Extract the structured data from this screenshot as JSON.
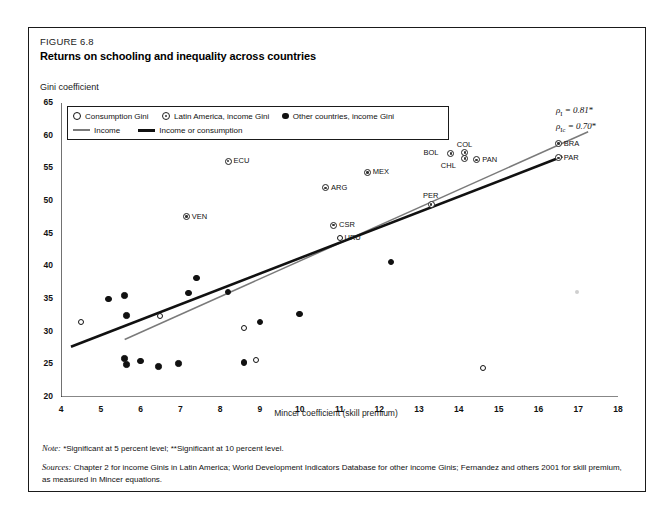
{
  "figure": {
    "number": "FIGURE 6.8",
    "title": "Returns on schooling and inequality across countries"
  },
  "axis": {
    "y_title": "Gini coefficient",
    "x_title": "Mincer coefficient (skill premium)",
    "y_ticks": [
      "20",
      "25",
      "30",
      "35",
      "40",
      "45",
      "50",
      "55",
      "60",
      "65"
    ],
    "x_ticks": [
      "4",
      "5",
      "6",
      "7",
      "8",
      "9",
      "10",
      "11",
      "12",
      "13",
      "14",
      "15",
      "16",
      "17",
      "18"
    ]
  },
  "legend": {
    "items": [
      {
        "label": "Consumption Gini",
        "marker": "hollow-circle-icon"
      },
      {
        "label": "Latin America, income Gini",
        "marker": "target-circle-icon"
      },
      {
        "label": "Other countries, income Gini",
        "marker": "filled-circle-icon"
      },
      {
        "label": "Income",
        "marker": "gray-line-icon"
      },
      {
        "label": "Income or consumption",
        "marker": "black-line-icon"
      }
    ]
  },
  "annotations": {
    "rho_income": {
      "symbol": "ρ",
      "sub": "I",
      "text": " = 0.81",
      "star": "*"
    },
    "rho_income_consumption": {
      "symbol": "ρ",
      "sub": "Ic",
      "text": " = 0.70",
      "star": "*"
    }
  },
  "footnotes": {
    "note_label": "Note:",
    "note_text": "*Significant at 5 percent level; **Significant at 10 percent level.",
    "sources_label": "Sources:",
    "sources_text": "Chapter 2 for income Ginis in Latin America; World Development Indicators Database for other income Ginis; Fernandez and others 2001 for skill premium, as measured in Mincer equations."
  },
  "colors": {
    "income_line": "#7a7a7a",
    "income_or_consumption_line": "#111111",
    "frame": "#1a1a1a"
  },
  "chart_data": {
    "type": "scatter",
    "title": "Returns on schooling and inequality across countries",
    "xlabel": "Mincer coefficient (skill premium)",
    "ylabel": "Gini coefficient",
    "xlim": [
      4,
      18
    ],
    "ylim": [
      20,
      65
    ],
    "grid": false,
    "legend_position": "top-left inside plot",
    "series": [
      {
        "name": "Latin America, income Gini",
        "marker": "target-circle",
        "points": [
          {
            "label": "ECU",
            "x": 8.2,
            "y": 56.1,
            "label_pos": "right"
          },
          {
            "label": "VEN",
            "x": 7.15,
            "y": 47.6,
            "label_pos": "right"
          },
          {
            "label": "ARG",
            "x": 10.65,
            "y": 52.0,
            "label_pos": "right"
          },
          {
            "label": "MEX",
            "x": 11.7,
            "y": 54.4,
            "label_pos": "right"
          },
          {
            "label": "CSR",
            "x": 10.85,
            "y": 46.3,
            "label_pos": "right"
          },
          {
            "label": "PER",
            "x": 13.3,
            "y": 49.5,
            "label_pos": "above"
          },
          {
            "label": "BOL",
            "x": 13.8,
            "y": 57.3,
            "label_pos": "left"
          },
          {
            "label": "COL",
            "x": 14.15,
            "y": 57.4,
            "label_pos": "above"
          },
          {
            "label": "CHL",
            "x": 14.15,
            "y": 56.5,
            "label_pos": "below-left"
          },
          {
            "label": "PAN",
            "x": 14.45,
            "y": 56.3,
            "label_pos": "right"
          },
          {
            "label": "BRA",
            "x": 16.5,
            "y": 58.8,
            "label_pos": "right"
          },
          {
            "label": "PAR",
            "x": 16.5,
            "y": 56.6,
            "label_pos": "right"
          }
        ]
      },
      {
        "name": "Consumption Gini",
        "marker": "hollow-circle",
        "points": [
          {
            "label": "URU",
            "x": 11.0,
            "y": 44.4,
            "label_pos": "right"
          },
          {
            "label": "",
            "x": 4.5,
            "y": 31.5
          },
          {
            "label": "",
            "x": 6.5,
            "y": 32.4
          },
          {
            "label": "",
            "x": 8.6,
            "y": 30.6
          },
          {
            "label": "",
            "x": 8.9,
            "y": 25.7
          },
          {
            "label": "",
            "x": 14.6,
            "y": 24.4
          }
        ]
      },
      {
        "name": "Other countries, income Gini",
        "marker": "filled-circle",
        "points": [
          {
            "x": 5.2,
            "y": 35.0
          },
          {
            "x": 5.6,
            "y": 35.5
          },
          {
            "x": 5.65,
            "y": 32.5
          },
          {
            "x": 7.2,
            "y": 35.9
          },
          {
            "x": 7.4,
            "y": 38.2
          },
          {
            "x": 8.2,
            "y": 36.1
          },
          {
            "x": 9.0,
            "y": 31.5
          },
          {
            "x": 10.0,
            "y": 32.7
          },
          {
            "x": 12.3,
            "y": 40.7
          },
          {
            "x": 5.6,
            "y": 25.9
          },
          {
            "x": 5.65,
            "y": 25.0
          },
          {
            "x": 6.0,
            "y": 25.5
          },
          {
            "x": 6.45,
            "y": 24.7
          },
          {
            "x": 6.95,
            "y": 25.1
          },
          {
            "x": 8.6,
            "y": 25.3
          }
        ]
      }
    ],
    "trend_lines": [
      {
        "name": "Income",
        "color": "#7a7a7a",
        "x0": 5.6,
        "y0": 28.8,
        "x1": 17.25,
        "y1": 60.6
      },
      {
        "name": "Income or consumption",
        "color": "#111111",
        "x0": 4.25,
        "y0": 27.7,
        "x1": 16.6,
        "y1": 56.8
      }
    ]
  }
}
